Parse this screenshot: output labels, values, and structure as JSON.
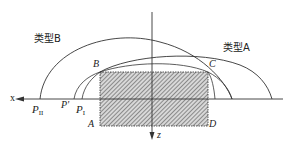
{
  "diagram": {
    "labels": {
      "type_b": "类型B",
      "type_a": "类型A",
      "corner_b": "B",
      "corner_c": "C",
      "corner_a": "A",
      "corner_d": "D",
      "axis_x": "x",
      "axis_z": "z",
      "point_p_prime": "P'",
      "point_p1_main": "P",
      "point_p1_sub": "I",
      "point_p2_main": "P",
      "point_p2_sub": "II"
    },
    "colors": {
      "line": "#333333",
      "hatch": "#555555",
      "background": "#ffffff"
    }
  }
}
